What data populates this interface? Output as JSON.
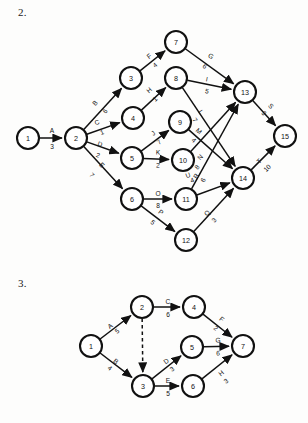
{
  "page": {
    "background_color": "#fdfdfc",
    "ink_color": "#111111"
  },
  "problems": [
    {
      "number": "2.",
      "id": "q2"
    },
    {
      "number": "3.",
      "id": "q3"
    }
  ],
  "chart_data": [
    {
      "type": "diagram",
      "diagram_kind": "activity-on-arrow network (AOA / CPM)",
      "title": "2.",
      "nodes": [
        {
          "id": "1",
          "label": "1",
          "x": 28,
          "y": 138
        },
        {
          "id": "2",
          "label": "2",
          "x": 76,
          "y": 138
        },
        {
          "id": "3",
          "label": "3",
          "x": 131,
          "y": 78
        },
        {
          "id": "4",
          "label": "4",
          "x": 133,
          "y": 118
        },
        {
          "id": "5",
          "label": "5",
          "x": 132,
          "y": 158
        },
        {
          "id": "6",
          "label": "6",
          "x": 132,
          "y": 199
        },
        {
          "id": "7",
          "label": "7",
          "x": 176,
          "y": 42
        },
        {
          "id": "8",
          "label": "8",
          "x": 176,
          "y": 78
        },
        {
          "id": "9",
          "label": "9",
          "x": 180,
          "y": 122
        },
        {
          "id": "10",
          "label": "10",
          "x": 183,
          "y": 160
        },
        {
          "id": "11",
          "label": "11",
          "x": 186,
          "y": 199
        },
        {
          "id": "12",
          "label": "12",
          "x": 186,
          "y": 240
        },
        {
          "id": "13",
          "label": "13",
          "x": 245,
          "y": 92
        },
        {
          "id": "14",
          "label": "14",
          "x": 243,
          "y": 178
        },
        {
          "id": "15",
          "label": "15",
          "x": 285,
          "y": 136
        }
      ],
      "node_radius": 11,
      "edges": [
        {
          "name": "A",
          "duration": "3",
          "from": "1",
          "to": "2",
          "lx": 52,
          "ly": 130,
          "dx": 52,
          "dy": 146,
          "dashed": false
        },
        {
          "name": "B",
          "duration": "6",
          "from": "2",
          "to": "3",
          "lx": 95,
          "ly": 103,
          "dx": 105,
          "dy": 111,
          "dashed": false
        },
        {
          "name": "C",
          "duration": "1",
          "from": "2",
          "to": "4",
          "lx": 97,
          "ly": 122,
          "dx": 102,
          "dy": 132,
          "dashed": false
        },
        {
          "name": "D",
          "duration": "2",
          "from": "2",
          "to": "5",
          "lx": 100,
          "ly": 144,
          "dx": 98,
          "dy": 155,
          "dashed": false
        },
        {
          "name": "E",
          "duration": "7",
          "from": "2",
          "to": "6",
          "lx": 102,
          "ly": 165,
          "dx": 92,
          "dy": 175,
          "dashed": false
        },
        {
          "name": "F",
          "duration": "4",
          "from": "3",
          "to": "7",
          "lx": 149,
          "ly": 56,
          "dx": 155,
          "dy": 65,
          "dashed": false
        },
        {
          "name": "G",
          "duration": "6",
          "from": "7",
          "to": "13",
          "lx": 211,
          "ly": 56,
          "dx": 205,
          "dy": 66,
          "dashed": false
        },
        {
          "name": "H",
          "duration": "1",
          "from": "4",
          "to": "8",
          "lx": 149,
          "ly": 90,
          "dx": 155,
          "dy": 99,
          "dashed": false
        },
        {
          "name": "I",
          "duration": "5",
          "from": "8",
          "to": "13",
          "lx": 207,
          "ly": 79,
          "dx": 207,
          "dy": 91,
          "dashed": false
        },
        {
          "name": "J",
          "duration": "7",
          "from": "5",
          "to": "9",
          "lx": 153,
          "ly": 133,
          "dx": 159,
          "dy": 142,
          "dashed": false
        },
        {
          "name": "K",
          "duration": "2",
          "from": "5",
          "to": "10",
          "lx": 158,
          "ly": 152,
          "dx": 158,
          "dy": 165,
          "dashed": false
        },
        {
          "name": "L",
          "duration": "7",
          "from": "8",
          "to": "14",
          "lx": 201,
          "ly": 112,
          "dx": 195,
          "dy": 120,
          "dashed": false
        },
        {
          "name": "M",
          "duration": "4",
          "from": "9",
          "to": "14",
          "lx": 199,
          "ly": 131,
          "dx": 194,
          "dy": 140,
          "dashed": false
        },
        {
          "name": "N",
          "duration": "8",
          "from": "10",
          "to": "13",
          "lx": 200,
          "ly": 157,
          "dx": 197,
          "dy": 167,
          "dashed": false
        },
        {
          "name": "O",
          "duration": "8",
          "from": "6",
          "to": "11",
          "lx": 158,
          "ly": 193,
          "dx": 158,
          "dy": 205,
          "dashed": false
        },
        {
          "name": "P",
          "duration": "5",
          "from": "6",
          "to": "12",
          "lx": 161,
          "ly": 212,
          "dx": 153,
          "dy": 222,
          "dashed": false
        },
        {
          "name": "R",
          "duration": "6",
          "from": "11",
          "to": "13",
          "lx": 196,
          "ly": 176,
          "dx": 203,
          "dy": 180,
          "dashed": false
        },
        {
          "name": "U",
          "duration": "4",
          "from": "11",
          "to": "14",
          "lx": 188,
          "ly": 175,
          "dx": 192,
          "dy": 180,
          "dashed": false
        },
        {
          "name": "Q",
          "duration": "3",
          "from": "12",
          "to": "14",
          "lx": 207,
          "ly": 213,
          "dx": 214,
          "dy": 220,
          "dashed": false
        },
        {
          "name": "S",
          "duration": "3",
          "from": "13",
          "to": "15",
          "lx": 271,
          "ly": 106,
          "dx": 264,
          "dy": 113,
          "dashed": false
        },
        {
          "name": "T",
          "duration": "10",
          "from": "14",
          "to": "15",
          "lx": 259,
          "ly": 161,
          "dx": 267,
          "dy": 168,
          "dashed": false
        }
      ]
    },
    {
      "type": "diagram",
      "diagram_kind": "activity-on-arrow network (AOA / CPM) with dummy activity",
      "title": "3.",
      "nodes": [
        {
          "id": "1",
          "label": "1",
          "x": 91,
          "y": 78
        },
        {
          "id": "2",
          "label": "2",
          "x": 142,
          "y": 39
        },
        {
          "id": "3",
          "label": "3",
          "x": 143,
          "y": 118
        },
        {
          "id": "4",
          "label": "4",
          "x": 194,
          "y": 39
        },
        {
          "id": "5",
          "label": "5",
          "x": 192,
          "y": 79
        },
        {
          "id": "6",
          "label": "6",
          "x": 193,
          "y": 118
        },
        {
          "id": "7",
          "label": "7",
          "x": 243,
          "y": 78
        }
      ],
      "node_radius": 11,
      "edges": [
        {
          "name": "A",
          "duration": "5",
          "from": "1",
          "to": "2",
          "lx": 110,
          "ly": 58,
          "dx": 117,
          "dy": 63,
          "dashed": false
        },
        {
          "name": "B",
          "duration": "4",
          "from": "1",
          "to": "3",
          "lx": 116,
          "ly": 93,
          "dx": 110,
          "dy": 100,
          "dashed": false
        },
        {
          "name": "C",
          "duration": "6",
          "from": "2",
          "to": "4",
          "lx": 168,
          "ly": 33,
          "dx": 168,
          "dy": 46,
          "dashed": false
        },
        {
          "name": "",
          "duration": "",
          "from": "2",
          "to": "3",
          "lx": 0,
          "ly": 0,
          "dx": 0,
          "dy": 0,
          "dashed": true
        },
        {
          "name": "D",
          "duration": "3",
          "from": "3",
          "to": "5",
          "lx": 166,
          "ly": 93,
          "dx": 172,
          "dy": 101,
          "dashed": false
        },
        {
          "name": "E",
          "duration": "5",
          "from": "3",
          "to": "6",
          "lx": 168,
          "ly": 112,
          "dx": 168,
          "dy": 125,
          "dashed": false
        },
        {
          "name": "F",
          "duration": "2",
          "from": "4",
          "to": "7",
          "lx": 222,
          "ly": 51,
          "dx": 216,
          "dy": 60,
          "dashed": false
        },
        {
          "name": "G",
          "duration": "6",
          "from": "5",
          "to": "7",
          "lx": 218,
          "ly": 72,
          "dx": 218,
          "dy": 85,
          "dashed": false
        },
        {
          "name": "H",
          "duration": "3",
          "from": "6",
          "to": "7",
          "lx": 221,
          "ly": 105,
          "dx": 226,
          "dy": 113,
          "dashed": false
        }
      ]
    }
  ]
}
